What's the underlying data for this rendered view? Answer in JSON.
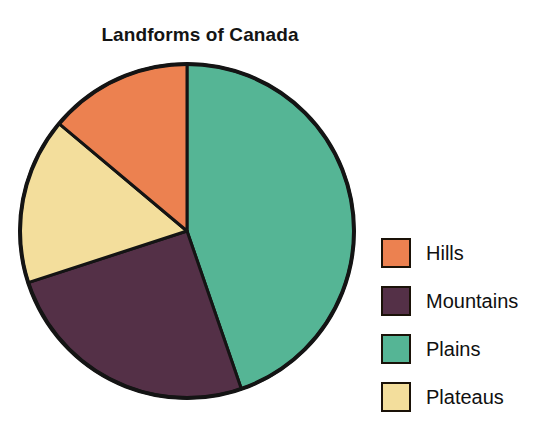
{
  "chart_data": {
    "type": "pie",
    "title": "Landforms of Canada",
    "categories": [
      "Hills",
      "Mountains",
      "Plains",
      "Plateaus"
    ],
    "values": [
      14,
      25,
      45,
      16
    ],
    "unit": "percent",
    "colors": {
      "Hills": "#EC8150",
      "Mountains": "#543047",
      "Plains": "#55B595",
      "Plateaus": "#F3DE9C"
    },
    "slice_order_clockwise_from_12": [
      "Plains",
      "Mountains",
      "Plateaus",
      "Hills"
    ],
    "slice_angles_deg": {
      "Plains": {
        "start": 0,
        "end": 161
      },
      "Mountains": {
        "start": 161,
        "end": 252
      },
      "Plateaus": {
        "start": 252,
        "end": 310
      },
      "Hills": {
        "start": 310,
        "end": 360
      }
    },
    "legend_position": "right",
    "grid": false,
    "xlabel": "",
    "ylabel": ""
  },
  "legend": {
    "items": [
      {
        "label": "Hills",
        "color": "#EC8150"
      },
      {
        "label": "Mountains",
        "color": "#543047"
      },
      {
        "label": "Plains",
        "color": "#55B595"
      },
      {
        "label": "Plateaus",
        "color": "#F3DE9C"
      }
    ]
  },
  "style": {
    "background": "#FFFFFF",
    "outline": "#141414",
    "text": "#101010"
  }
}
